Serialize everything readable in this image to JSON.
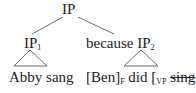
{
  "tree": {
    "root": "IP",
    "left": {
      "label": "IP",
      "subscript": "1",
      "terminal": "Abby sang"
    },
    "right": {
      "prefix": "because",
      "label": "IP",
      "subscript": "2",
      "terminal": {
        "part1": "[Ben]",
        "focus_sub": "F",
        "part2": " did [",
        "vp_sub": "VP",
        "elided": "sing",
        "part3": "]."
      }
    }
  }
}
